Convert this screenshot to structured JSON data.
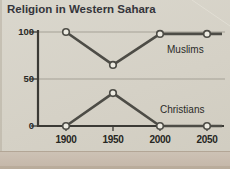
{
  "page": {
    "title": "Religion in Western Sahara"
  },
  "chart_data": {
    "type": "line",
    "title": "Religion in Western Sahara",
    "categories": [
      "1900",
      "1950",
      "2000",
      "2050"
    ],
    "series": [
      {
        "name": "Muslims",
        "values": [
          100,
          65,
          98,
          98
        ]
      },
      {
        "name": "Christians",
        "values": [
          0,
          35,
          0,
          0
        ]
      }
    ],
    "xlabel": "",
    "ylabel": "",
    "ylim": [
      0,
      100
    ],
    "yticks": [
      "100",
      "50",
      "0"
    ],
    "grid": "horizontal gridlines at 50 and 100",
    "legend_position": "inline labels beside lines",
    "line_color": "#4d4c46",
    "marker_fill": "#edebe2",
    "marker_style": "open-circle"
  },
  "colors": {
    "background": "#d5d1c6",
    "axis": "#3b3a35",
    "grid": "#a5a196",
    "text": "#2a2a26"
  }
}
